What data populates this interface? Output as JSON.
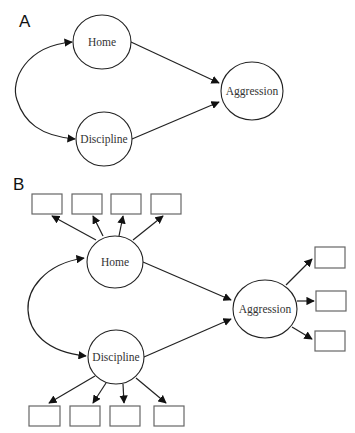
{
  "panels": [
    {
      "label": "A",
      "nodes": {
        "home": "Home",
        "discipline": "Discipline",
        "aggression": "Aggression"
      },
      "edges": [
        {
          "from": "Home",
          "to": "Aggression",
          "type": "directed"
        },
        {
          "from": "Discipline",
          "to": "Aggression",
          "type": "directed"
        },
        {
          "from": "Home",
          "to": "Discipline",
          "type": "bidirectional-curved"
        }
      ]
    },
    {
      "label": "B",
      "nodes": {
        "home": "Home",
        "discipline": "Discipline",
        "aggression": "Aggression"
      },
      "indicators": {
        "home": 4,
        "discipline": 4,
        "aggression": 3
      },
      "edges": [
        {
          "from": "Home",
          "to": "Aggression",
          "type": "directed"
        },
        {
          "from": "Discipline",
          "to": "Aggression",
          "type": "directed"
        },
        {
          "from": "Home",
          "to": "Discipline",
          "type": "bidirectional-curved"
        }
      ]
    }
  ],
  "colors": {
    "stroke": "#222222",
    "box_stroke": "#666666",
    "background": "#ffffff"
  }
}
